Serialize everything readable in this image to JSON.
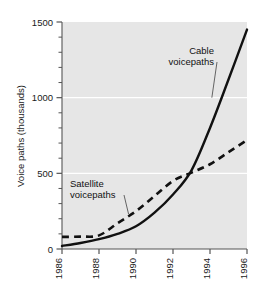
{
  "chart_data": {
    "type": "line",
    "title": "",
    "subtitle": "",
    "xlabel": "",
    "ylabel": "Voice paths (thousands)",
    "xlim": [
      1986,
      1996
    ],
    "ylim": [
      0,
      1500
    ],
    "xticks": [
      "1986",
      "1988",
      "1990",
      "1992",
      "1994",
      "1996"
    ],
    "xtick_values": [
      1986,
      1988,
      1990,
      1992,
      1994,
      1996
    ],
    "yticks": [
      "0",
      "500",
      "1000",
      "1500"
    ],
    "ytick_values": [
      0,
      500,
      1000,
      1500
    ],
    "yminor_step": 100,
    "grid": "horizontal-major-white",
    "legend": "none",
    "plot_background": "#e6e6e6",
    "series": [
      {
        "name": "Cable voicepaths",
        "style": "solid",
        "color": "#111111",
        "x": [
          1986,
          1987,
          1988,
          1989,
          1990,
          1991,
          1992,
          1993,
          1994,
          1995,
          1996
        ],
        "values": [
          20,
          40,
          65,
          100,
          150,
          240,
          360,
          520,
          800,
          1120,
          1450
        ]
      },
      {
        "name": "Satellite voicepaths",
        "style": "dashed",
        "color": "#111111",
        "x": [
          1986,
          1987,
          1988,
          1989,
          1990,
          1991,
          1992,
          1993,
          1994,
          1995,
          1996
        ],
        "values": [
          80,
          82,
          90,
          170,
          250,
          350,
          450,
          505,
          560,
          640,
          720
        ]
      }
    ],
    "annotations": [
      {
        "text_line1": "Cable",
        "text_line2": "voicepaths",
        "target_series": "Cable voicepaths",
        "target_x": 1994.1,
        "target_y": 1000
      },
      {
        "text_line1": "Satellite",
        "text_line2": "voicepaths",
        "target_series": "Satellite voicepaths",
        "target_x": 1989.6,
        "target_y": 230
      }
    ]
  }
}
